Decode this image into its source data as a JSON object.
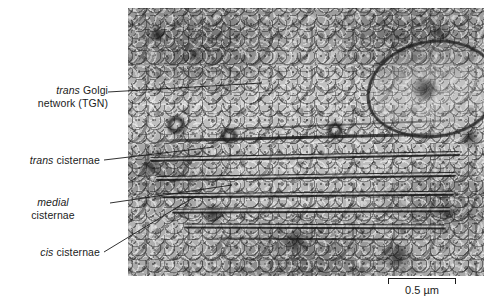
{
  "figure": {
    "type": "electron-micrograph",
    "background_color": "#ffffff",
    "text_color": "#1b1b1b"
  },
  "labels": [
    {
      "id": "tgn",
      "line1_italic": "trans",
      "line1_roman": " Golgi",
      "line2": "network (TGN)"
    },
    {
      "id": "trans-cisternae",
      "line1_italic": "trans",
      "line1_roman": " cisternae",
      "line2": ""
    },
    {
      "id": "medial-cisternae",
      "line1_italic": "medial",
      "line1_roman": "",
      "line2": "cisternae"
    },
    {
      "id": "cis-cisternae",
      "line1_italic": "cis",
      "line1_roman": " cisternae",
      "line2": ""
    }
  ],
  "scale_bar": {
    "label": "0.5 µm",
    "value": 0.5,
    "unit": "µm",
    "length_px": 68
  }
}
